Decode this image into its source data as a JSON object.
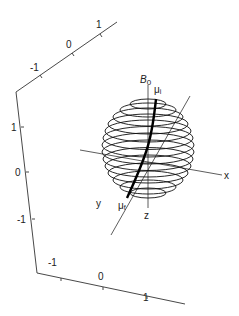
{
  "figure": {
    "type": "3d-sphere-diagram",
    "axes_box": {
      "top_axis_ticks": [
        "-1",
        "0",
        "1"
      ],
      "left_axis_ticks": [
        "1",
        "0",
        "-1"
      ],
      "bottom_axis_ticks": [
        "-1",
        "0",
        "1"
      ]
    },
    "sphere": {
      "latitude_rings": 14,
      "axis_labels": {
        "x": "x",
        "y": "y",
        "z": "z"
      },
      "field_label": "B",
      "field_subscript": "0",
      "initial_moment_label": "μ",
      "initial_moment_subscript": "i",
      "final_moment_label": "μ",
      "final_moment_subscript": "f"
    },
    "colors": {
      "line": "#111111",
      "axis": "#333333",
      "background": "#ffffff"
    }
  }
}
